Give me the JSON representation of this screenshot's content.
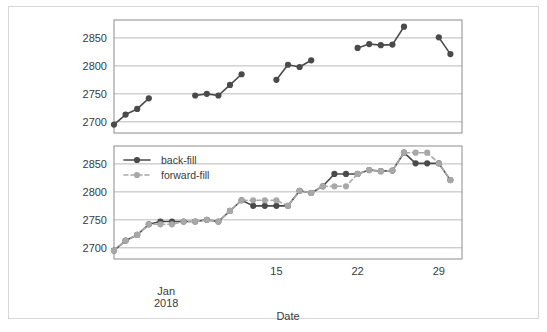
{
  "figure": {
    "xlabel": "Date",
    "x_period_label_line1": "Jan",
    "x_period_label_line2": "2018",
    "background_color": "#ffffff",
    "border_color": "#d7d7d7"
  },
  "colors": {
    "backfill": "#4a4a4a",
    "forwardfill": "#a8a8a8",
    "gridline": "#b9b9b9",
    "frame": "#8c8c8c",
    "text": "#3a3a3a"
  },
  "legend": {
    "position": "top-left",
    "entries": [
      {
        "label": "back-fill",
        "color": "#4a4a4a",
        "style": "solid",
        "marker": "circle"
      },
      {
        "label": "forward-fill",
        "color": "#a8a8a8",
        "style": "dashed",
        "marker": "circle"
      }
    ]
  },
  "chart_data": [
    {
      "id": "top-panel",
      "type": "line",
      "title": "",
      "xlabel": "",
      "ylabel": "",
      "grid": true,
      "legend": false,
      "xlim": [
        1,
        31
      ],
      "ylim": [
        2680,
        2882
      ],
      "yticks": [
        2700,
        2750,
        2800,
        2850
      ],
      "xticks": [
        15,
        22,
        29
      ],
      "xtick_labels": [
        "15",
        "22",
        "29"
      ],
      "series": [
        {
          "name": "back-fill",
          "color": "#4a4a4a",
          "style": "solid",
          "marker": "circle",
          "x": [
            1,
            2,
            3,
            4,
            8,
            9,
            10,
            11,
            12,
            15,
            16,
            17,
            18,
            22,
            23,
            24,
            25,
            26,
            29,
            30
          ],
          "values": [
            2695,
            2713,
            2723,
            2742,
            2747,
            2750,
            2747,
            2766,
            2785,
            2775,
            2802,
            2798,
            2810,
            2832,
            2839,
            2837,
            2838,
            2870,
            2851,
            2821
          ]
        }
      ]
    },
    {
      "id": "bottom-panel",
      "type": "line",
      "title": "",
      "xlabel": "Date",
      "ylabel": "",
      "grid": true,
      "legend": true,
      "xlim": [
        1,
        31
      ],
      "ylim": [
        2680,
        2882
      ],
      "yticks": [
        2700,
        2750,
        2800,
        2850
      ],
      "xticks": [
        15,
        22,
        29
      ],
      "xtick_labels": [
        "15",
        "22",
        "29"
      ],
      "series": [
        {
          "name": "back-fill",
          "color": "#4a4a4a",
          "style": "solid",
          "marker": "circle",
          "x": [
            1,
            2,
            3,
            4,
            5,
            6,
            7,
            8,
            9,
            10,
            11,
            12,
            13,
            14,
            15,
            16,
            17,
            18,
            19,
            20,
            21,
            22,
            23,
            24,
            25,
            26,
            27,
            28,
            29,
            30
          ],
          "values": [
            2695,
            2713,
            2723,
            2742,
            2747,
            2747,
            2747,
            2747,
            2750,
            2747,
            2766,
            2785,
            2775,
            2775,
            2775,
            2775,
            2802,
            2798,
            2810,
            2832,
            2832,
            2832,
            2839,
            2837,
            2838,
            2870,
            2851,
            2851,
            2851,
            2821
          ]
        },
        {
          "name": "forward-fill",
          "color": "#a8a8a8",
          "style": "dashed",
          "marker": "circle",
          "x": [
            1,
            2,
            3,
            4,
            5,
            6,
            7,
            8,
            9,
            10,
            11,
            12,
            13,
            14,
            15,
            16,
            17,
            18,
            19,
            20,
            21,
            22,
            23,
            24,
            25,
            26,
            27,
            28,
            29,
            30
          ],
          "values": [
            2695,
            2713,
            2723,
            2742,
            2742,
            2742,
            2747,
            2747,
            2750,
            2747,
            2766,
            2785,
            2785,
            2785,
            2785,
            2775,
            2802,
            2798,
            2810,
            2810,
            2810,
            2832,
            2839,
            2837,
            2838,
            2870,
            2870,
            2870,
            2851,
            2821
          ]
        }
      ]
    }
  ]
}
